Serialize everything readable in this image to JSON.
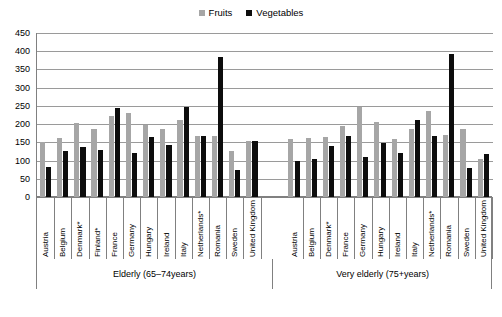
{
  "legend": {
    "position": "top-center",
    "entries": [
      {
        "label": "Fruits",
        "color": "#a6a6a6"
      },
      {
        "label": "Vegetables",
        "color": "#0d0d0d"
      }
    ]
  },
  "axis": {
    "y_ticks": [
      "0",
      "50",
      "100",
      "150",
      "200",
      "250",
      "300",
      "350",
      "400",
      "450"
    ],
    "ylim_min": 0,
    "ylim_max": 450,
    "grid": true
  },
  "groups": [
    {
      "label": "Elderly (65–74years)"
    },
    {
      "label": "Very elderly (75+years)"
    }
  ],
  "categories_g1": [
    "Austria",
    "Belgium",
    "Denmark*",
    "Finland*",
    "France",
    "Germany",
    "Hungary",
    "Ireland",
    "Italy",
    "Netherlands*",
    "Romania",
    "Sweden",
    "United Kingdom"
  ],
  "categories_g2": [
    "Austria",
    "Belgium",
    "Denmark*",
    "France",
    "Germany",
    "Hungary",
    "Ireland",
    "Italy",
    "Netherlands*",
    "Romania",
    "Sweden",
    "United Kingdom"
  ],
  "chart_data": {
    "type": "bar",
    "title": "",
    "xlabel": "",
    "ylabel": "",
    "ylim": [
      0,
      450
    ],
    "grid": true,
    "legend_position": "top-center",
    "groups": [
      {
        "name": "Elderly (65–74years)",
        "categories": [
          "Austria",
          "Belgium",
          "Denmark*",
          "Finland*",
          "France",
          "Germany",
          "Hungary",
          "Ireland",
          "Italy",
          "Netherlands*",
          "Romania",
          "Sweden",
          "United Kingdom"
        ],
        "series": [
          {
            "name": "Fruits",
            "values": [
              150,
              163,
              203,
              188,
              222,
              231,
              197,
              186,
              210,
              168,
              168,
              127,
              155
            ]
          },
          {
            "name": "Vegetables",
            "values": [
              81,
              126,
              138,
              128,
              243,
              122,
              165,
              143,
              247,
              167,
              385,
              74,
              155
            ]
          }
        ]
      },
      {
        "name": "Very elderly (75+years)",
        "categories": [
          "Austria",
          "Belgium",
          "Denmark*",
          "France",
          "Germany",
          "Hungary",
          "Ireland",
          "Italy",
          "Netherlands*",
          "Romania",
          "Sweden",
          "United Kingdom"
        ],
        "series": [
          {
            "name": "Fruits",
            "values": [
              158,
              161,
              166,
              196,
              247,
              205,
              158,
              188,
              236,
              169,
              186,
              103
            ]
          },
          {
            "name": "Vegetables",
            "values": [
              98,
              105,
              139,
              167,
              111,
              147,
              120,
              210,
              168,
              392,
              80,
              119
            ]
          }
        ]
      }
    ]
  }
}
